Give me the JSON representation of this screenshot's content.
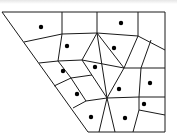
{
  "diagram": {
    "type": "voronoi-partition",
    "colors": {
      "line": "#1a1a1a",
      "point": "#000000",
      "background": "#ffffff"
    },
    "boundary": [
      [
        2,
        12
      ],
      [
        165,
        12
      ],
      [
        165,
        132
      ],
      [
        88,
        132
      ]
    ],
    "edges": [
      [
        [
          62,
          12
        ],
        [
          62,
          34
        ]
      ],
      [
        [
          97,
          12
        ],
        [
          97,
          33
        ]
      ],
      [
        [
          138,
          12
        ],
        [
          138,
          36
        ]
      ],
      [
        [
          24,
          42
        ],
        [
          62,
          34
        ],
        [
          97,
          33
        ],
        [
          138,
          36
        ],
        [
          165,
          50
        ]
      ],
      [
        [
          62,
          34
        ],
        [
          58,
          61
        ]
      ],
      [
        [
          39,
          63
        ],
        [
          58,
          61
        ],
        [
          82,
          60
        ],
        [
          124,
          68
        ],
        [
          141,
          68
        ],
        [
          165,
          68
        ]
      ],
      [
        [
          97,
          33
        ],
        [
          82,
          60
        ]
      ],
      [
        [
          97,
          33
        ],
        [
          124,
          68
        ]
      ],
      [
        [
          97,
          33
        ],
        [
          107,
          98
        ]
      ],
      [
        [
          138,
          36
        ],
        [
          124,
          68
        ]
      ],
      [
        [
          151,
          40
        ],
        [
          141,
          68
        ]
      ],
      [
        [
          82,
          60
        ],
        [
          107,
          98
        ]
      ],
      [
        [
          124,
          68
        ],
        [
          107,
          98
        ]
      ],
      [
        [
          58,
          61
        ],
        [
          71,
          78
        ]
      ],
      [
        [
          54,
          86
        ],
        [
          71,
          78
        ],
        [
          92,
          75
        ]
      ],
      [
        [
          71,
          78
        ],
        [
          86,
          101
        ]
      ],
      [
        [
          73,
          108
        ],
        [
          86,
          101
        ],
        [
          107,
          98
        ]
      ],
      [
        [
          141,
          68
        ],
        [
          139,
          97
        ]
      ],
      [
        [
          107,
          98
        ],
        [
          139,
          97
        ],
        [
          165,
          97
        ]
      ],
      [
        [
          139,
          97
        ],
        [
          139,
          110
        ],
        [
          165,
          115
        ]
      ],
      [
        [
          107,
          98
        ],
        [
          99,
          132
        ]
      ],
      [
        [
          107,
          98
        ],
        [
          115,
          132
        ]
      ],
      [
        [
          139,
          110
        ],
        [
          133,
          132
        ]
      ]
    ],
    "sites": [
      [
        41,
        27
      ],
      [
        121,
        23
      ],
      [
        67,
        46
      ],
      [
        114,
        48
      ],
      [
        95,
        67
      ],
      [
        63,
        71
      ],
      [
        150,
        83
      ],
      [
        119,
        89
      ],
      [
        77,
        94
      ],
      [
        144,
        104
      ],
      [
        91,
        117
      ],
      [
        125,
        118
      ]
    ],
    "site_count": 12
  }
}
